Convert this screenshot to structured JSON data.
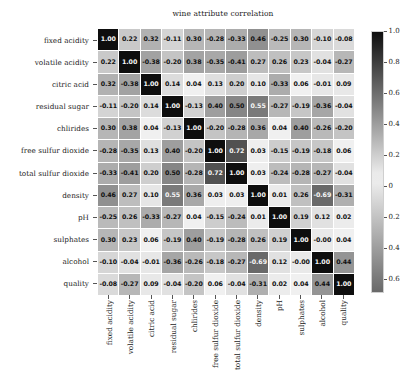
{
  "chart_data": {
    "type": "heatmap",
    "title": "wine attribute correlation",
    "xlabel": "",
    "ylabel": "",
    "grid": false,
    "legend_position": "right",
    "colorbar": {
      "ticks": [
        "1.0",
        "0.8",
        "0.6",
        "0.4",
        "0.2",
        "0",
        "0.2",
        "0.4",
        "0.6"
      ],
      "tick_values": [
        1.0,
        0.8,
        0.6,
        0.4,
        0.2,
        0.0,
        -0.2,
        -0.4,
        -0.6
      ],
      "vmin": -0.69,
      "vmax": 1.0,
      "cmap": "gray-diverging",
      "dark_color": "#111111",
      "light_color": "#f0f0f0"
    },
    "categories": [
      "fixed acidity",
      "volatile acidity",
      "citric acid",
      "residual sugar",
      "chlirides",
      "free sulfur dioxide",
      "total sulfur dioxide",
      "density",
      "pH",
      "sulphates",
      "alcohol",
      "quality"
    ],
    "x": [
      "fixed acidity",
      "volatile acidity",
      "citric acid",
      "residual sugar",
      "chlirides",
      "free sulfur dioxide",
      "total sulfur dioxide",
      "density",
      "pH",
      "sulphates",
      "alcohol",
      "quality"
    ],
    "y": [
      "fixed acidity",
      "volatile acidity",
      "citric acid",
      "residual sugar",
      "chlirides",
      "free sulfur dioxide",
      "total sulfur dioxide",
      "density",
      "pH",
      "sulphates",
      "alcohol",
      "quality"
    ],
    "values": [
      [
        1.0,
        0.22,
        0.32,
        -0.11,
        0.3,
        -0.28,
        -0.33,
        0.46,
        -0.25,
        0.3,
        -0.1,
        -0.08
      ],
      [
        0.22,
        1.0,
        -0.38,
        -0.2,
        0.38,
        -0.35,
        -0.41,
        0.27,
        0.26,
        0.23,
        -0.04,
        -0.27
      ],
      [
        0.32,
        -0.38,
        1.0,
        0.14,
        0.04,
        0.13,
        0.2,
        0.1,
        -0.33,
        0.06,
        -0.01,
        0.09
      ],
      [
        -0.11,
        -0.2,
        0.14,
        1.0,
        -0.13,
        0.4,
        0.5,
        0.55,
        -0.27,
        -0.19,
        -0.36,
        -0.04
      ],
      [
        0.3,
        0.38,
        0.04,
        -0.13,
        1.0,
        -0.2,
        -0.28,
        0.36,
        0.04,
        0.4,
        -0.26,
        -0.2
      ],
      [
        -0.28,
        -0.35,
        0.13,
        0.4,
        -0.2,
        1.0,
        0.72,
        0.03,
        -0.15,
        -0.19,
        -0.18,
        0.06
      ],
      [
        -0.33,
        -0.41,
        0.2,
        0.5,
        -0.28,
        0.72,
        1.0,
        0.03,
        -0.24,
        -0.28,
        -0.27,
        -0.04
      ],
      [
        0.46,
        0.27,
        0.1,
        0.55,
        0.36,
        0.03,
        0.03,
        1.0,
        0.01,
        0.26,
        -0.69,
        -0.31
      ],
      [
        -0.25,
        0.26,
        -0.33,
        -0.27,
        0.04,
        -0.15,
        -0.24,
        0.01,
        1.0,
        0.19,
        0.12,
        0.02
      ],
      [
        0.3,
        0.23,
        0.06,
        -0.19,
        0.4,
        -0.19,
        -0.28,
        0.26,
        0.19,
        1.0,
        -0.0,
        0.04
      ],
      [
        -0.1,
        -0.04,
        -0.01,
        -0.36,
        -0.26,
        -0.18,
        -0.27,
        -0.69,
        0.12,
        -0.0,
        1.0,
        0.44
      ],
      [
        -0.08,
        -0.27,
        0.09,
        -0.04,
        -0.2,
        0.06,
        -0.04,
        -0.31,
        0.02,
        0.04,
        0.44,
        1.0
      ]
    ],
    "labels": [
      [
        "1.00",
        "0.22",
        "0.32",
        "-0.11",
        "0.30",
        "-0.28",
        "-0.33",
        "0.46",
        "-0.25",
        "0.30",
        "-0.10",
        "-0.08"
      ],
      [
        "0.22",
        "1.00",
        "-0.38",
        "-0.20",
        "0.38",
        "-0.35",
        "-0.41",
        "0.27",
        "0.26",
        "0.23",
        "-0.04",
        "-0.27"
      ],
      [
        "0.32",
        "-0.38",
        "1.00",
        "0.14",
        "0.04",
        "0.13",
        "0.20",
        "0.10",
        "-0.33",
        "0.06",
        "-0.01",
        "0.09"
      ],
      [
        "-0.11",
        "-0.20",
        "0.14",
        "1.00",
        "-0.13",
        "0.40",
        "0.50",
        "0.55",
        "-0.27",
        "-0.19",
        "-0.36",
        "-0.04"
      ],
      [
        "0.30",
        "0.38",
        "0.04",
        "-0.13",
        "1.00",
        "-0.20",
        "-0.28",
        "0.36",
        "0.04",
        "0.40",
        "-0.26",
        "-0.20"
      ],
      [
        "-0.28",
        "-0.35",
        "0.13",
        "0.40",
        "-0.20",
        "1.00",
        "0.72",
        "0.03",
        "-0.15",
        "-0.19",
        "-0.18",
        "0.06"
      ],
      [
        "-0.33",
        "-0.41",
        "0.20",
        "0.50",
        "-0.28",
        "0.72",
        "1.00",
        "0.03",
        "-0.24",
        "-0.28",
        "-0.27",
        "-0.04"
      ],
      [
        "0.46",
        "0.27",
        "0.10",
        "0.55",
        "0.36",
        "0.03",
        "0.03",
        "1.00",
        "0.01",
        "0.26",
        "-0.69",
        "-0.31"
      ],
      [
        "-0.25",
        "0.26",
        "-0.33",
        "-0.27",
        "0.04",
        "-0.15",
        "-0.24",
        "0.01",
        "1.00",
        "0.19",
        "0.12",
        "0.02"
      ],
      [
        "0.30",
        "0.23",
        "0.06",
        "-0.19",
        "0.40",
        "-0.19",
        "-0.28",
        "0.26",
        "0.19",
        "1.00",
        "-0.00",
        "0.04"
      ],
      [
        "-0.10",
        "-0.04",
        "-0.01",
        "-0.36",
        "-0.26",
        "-0.18",
        "-0.27",
        "-0.69",
        "0.12",
        "-0.00",
        "1.00",
        "0.44"
      ],
      [
        "-0.08",
        "-0.27",
        "0.09",
        "-0.04",
        "-0.20",
        "0.06",
        "-0.04",
        "-0.31",
        "0.02",
        "0.04",
        "0.44",
        "1.00"
      ]
    ]
  }
}
